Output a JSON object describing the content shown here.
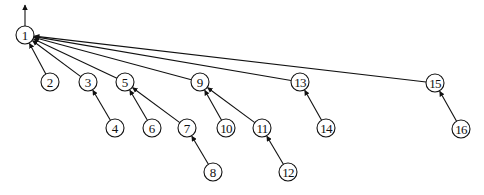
{
  "diagram": {
    "type": "tree",
    "root": "1",
    "root_arrow": {
      "from": [
        25,
        26
      ],
      "to": [
        25,
        5
      ]
    },
    "node_radius": 9,
    "nodes": [
      {
        "id": "1",
        "label": "1",
        "x": 25,
        "y": 35
      },
      {
        "id": "2",
        "label": "2",
        "x": 50,
        "y": 82
      },
      {
        "id": "3",
        "label": "3",
        "x": 88,
        "y": 82
      },
      {
        "id": "5",
        "label": "5",
        "x": 125,
        "y": 82
      },
      {
        "id": "9",
        "label": "9",
        "x": 200,
        "y": 82
      },
      {
        "id": "13",
        "label": "13",
        "x": 300,
        "y": 82
      },
      {
        "id": "15",
        "label": "15",
        "x": 435,
        "y": 83
      },
      {
        "id": "4",
        "label": "4",
        "x": 115,
        "y": 128
      },
      {
        "id": "6",
        "label": "6",
        "x": 152,
        "y": 128
      },
      {
        "id": "7",
        "label": "7",
        "x": 187,
        "y": 128
      },
      {
        "id": "10",
        "label": "10",
        "x": 226,
        "y": 128
      },
      {
        "id": "11",
        "label": "11",
        "x": 262,
        "y": 128
      },
      {
        "id": "14",
        "label": "14",
        "x": 326,
        "y": 128
      },
      {
        "id": "16",
        "label": "16",
        "x": 461,
        "y": 129
      },
      {
        "id": "8",
        "label": "8",
        "x": 213,
        "y": 172
      },
      {
        "id": "12",
        "label": "12",
        "x": 288,
        "y": 172
      }
    ],
    "edges": [
      {
        "from": "2",
        "to": "1"
      },
      {
        "from": "3",
        "to": "1"
      },
      {
        "from": "5",
        "to": "1"
      },
      {
        "from": "9",
        "to": "1"
      },
      {
        "from": "13",
        "to": "1"
      },
      {
        "from": "15",
        "to": "1"
      },
      {
        "from": "4",
        "to": "3"
      },
      {
        "from": "6",
        "to": "5"
      },
      {
        "from": "7",
        "to": "5"
      },
      {
        "from": "8",
        "to": "7"
      },
      {
        "from": "10",
        "to": "9"
      },
      {
        "from": "11",
        "to": "9"
      },
      {
        "from": "12",
        "to": "11"
      },
      {
        "from": "14",
        "to": "13"
      },
      {
        "from": "16",
        "to": "15"
      }
    ]
  }
}
